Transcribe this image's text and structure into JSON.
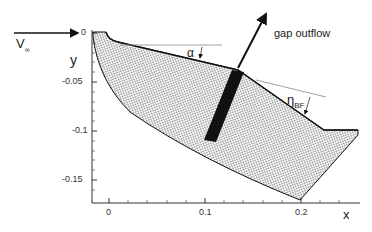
{
  "figure": {
    "freestream_label": "V",
    "freestream_sub": "∞",
    "gap_label": "gap outflow",
    "alpha_label": "α",
    "eta_label": "η",
    "eta_sub": "BF",
    "xlabel": "x",
    "ylabel": "y",
    "xticks": [
      "0",
      "0.1",
      "0.2"
    ],
    "yticks": [
      "0",
      "-0.05",
      "-0.1",
      "-0.15"
    ]
  },
  "colors": {
    "mesh": "#1a1a1a",
    "axis": "#333333",
    "refline": "#888888",
    "arrow": "#111111"
  }
}
